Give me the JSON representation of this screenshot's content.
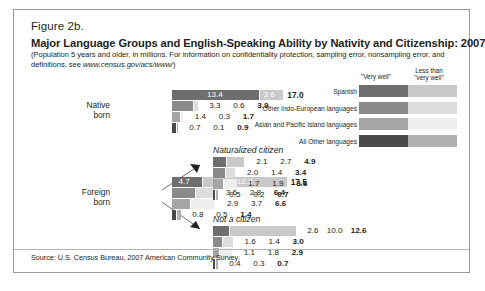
{
  "figure": {
    "number": "Figure 2b.",
    "title": "Major Language Groups and English-Speaking Ability by Nativity and Citizenship: 2007",
    "subtitle_part1": "(Population 5 years and older, in millions. For information on confidentiality protection, sampling error, nonsampling error, and definitions, see ",
    "subtitle_url": "www.census.gov/acs/www/",
    "subtitle_part2": ")",
    "source": "Source: U.S. Census Bureau, 2007 American Community Survey."
  },
  "legend": {
    "header_very_well": "\"Very well\"",
    "header_less_than": "Less than\n\"very well\"",
    "rows": [
      {
        "label": "Spanish",
        "color_very_well": "#6e6e6e",
        "color_less_than": "#c9c9c9"
      },
      {
        "label": "Other Indo-European languages",
        "color_very_well": "#8a8a8a",
        "color_less_than": "#dcdcdc"
      },
      {
        "label": "Asian and Pacific Island languages",
        "color_very_well": "#a5a5a5",
        "color_less_than": "#efefef"
      },
      {
        "label": "All Other languages",
        "color_very_well": "#4a4a4a",
        "color_less_than": "#b0b0b0"
      }
    ]
  },
  "colors": {
    "spanish_dark": "#6e6e6e",
    "spanish_light": "#c9c9c9",
    "indo_dark": "#8a8a8a",
    "indo_light": "#dcdcdc",
    "asian_dark": "#a5a5a5",
    "asian_light": "#efefef",
    "other_dark": "#4a4a4a",
    "other_light": "#b0b0b0",
    "frame": "#9b9b9b",
    "text": "#231f20"
  },
  "chart_data": {
    "type": "bar",
    "title": "Major Language Groups and English-Speaking Ability by Nativity and Citizenship: 2007",
    "subtitle": "(Population 5 years and older, in millions.)",
    "units": "millions",
    "stack_segments": [
      "\"Very well\"",
      "Less than \"very well\""
    ],
    "categories": [
      "Spanish",
      "Other Indo-European languages",
      "Asian and Pacific Island languages",
      "All Other languages"
    ],
    "groups": [
      {
        "name": "Native born",
        "label_lines": [
          "Native",
          "born"
        ],
        "rows": [
          {
            "category": "Spanish",
            "very_well": 13.4,
            "less_than": 3.6,
            "total": 17.0,
            "labels_inside": true
          },
          {
            "category": "Other Indo-European languages",
            "very_well": 3.3,
            "less_than": 0.6,
            "total": 3.9,
            "labels_inside": false
          },
          {
            "category": "Asian and Pacific Island languages",
            "very_well": 1.4,
            "less_than": 0.3,
            "total": 1.7,
            "labels_inside": false
          },
          {
            "category": "All Other languages",
            "very_well": 0.7,
            "less_than": 0.1,
            "total": 0.9,
            "labels_inside": false
          }
        ]
      },
      {
        "name": "Foreign born",
        "label_lines": [
          "Foreign",
          "born"
        ],
        "rows": [
          {
            "category": "Spanish",
            "very_well": 4.7,
            "less_than": 12.8,
            "total": 17.5,
            "labels_inside": true
          },
          {
            "category": "Other Indo-European languages",
            "very_well": 3.6,
            "less_than": 2.8,
            "total": 6.4,
            "labels_inside": false
          },
          {
            "category": "Asian and Pacific Island languages",
            "very_well": 2.9,
            "less_than": 3.7,
            "total": 6.6,
            "labels_inside": false
          },
          {
            "category": "All Other languages",
            "very_well": 0.8,
            "less_than": 0.5,
            "total": 1.4,
            "labels_inside": false
          }
        ]
      },
      {
        "name": "Naturalized citizen",
        "label_lines": [
          "Naturalized citizen"
        ],
        "rows": [
          {
            "category": "Spanish",
            "very_well": 2.1,
            "less_than": 2.7,
            "total": 4.9,
            "labels_inside": false
          },
          {
            "category": "Other Indo-European languages",
            "very_well": 2.0,
            "less_than": 1.4,
            "total": 3.4,
            "labels_inside": false
          },
          {
            "category": "Asian and Pacific Island languages",
            "very_well": 1.7,
            "less_than": 1.9,
            "total": 3.6,
            "labels_inside": false
          },
          {
            "category": "All Other languages",
            "very_well": 0.5,
            "less_than": 0.2,
            "total": 0.7,
            "labels_inside": false
          }
        ]
      },
      {
        "name": "Not a citizen",
        "label_lines": [
          "Not a citizen"
        ],
        "rows": [
          {
            "category": "Spanish",
            "very_well": 2.6,
            "less_than": 10.0,
            "total": 12.6,
            "labels_inside": false
          },
          {
            "category": "Other Indo-European languages",
            "very_well": 1.6,
            "less_than": 1.4,
            "total": 3.0,
            "labels_inside": false
          },
          {
            "category": "Asian and Pacific Island languages",
            "very_well": 1.1,
            "less_than": 1.8,
            "total": 2.9,
            "labels_inside": false
          },
          {
            "category": "All Other languages",
            "very_well": 0.4,
            "less_than": 0.3,
            "total": 0.7,
            "labels_inside": false
          }
        ]
      }
    ]
  }
}
